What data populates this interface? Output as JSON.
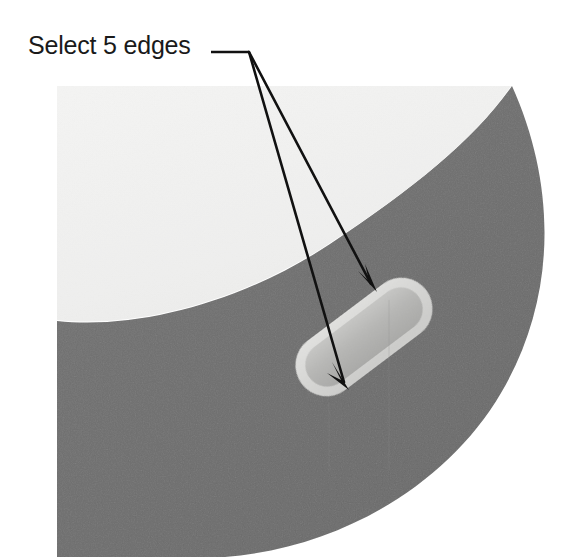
{
  "figure": {
    "kind": "cad-viewport-illustration",
    "width": 582,
    "height": 558,
    "background_color": "#ffffff",
    "annotation": {
      "label": "Select 5 edges",
      "label_color": "#1a1a1a",
      "leader": {
        "kind": "horizontal-leader-line",
        "color": "#111111",
        "from_x": 211,
        "to_x": 249,
        "y": 52
      },
      "arrows": [
        {
          "name": "arrow-to-slot-upper-edge",
          "start_x": 249,
          "start_y": 52,
          "tip_x": 377,
          "tip_y": 292,
          "color": "#111111"
        },
        {
          "name": "arrow-to-slot-lower-edge",
          "start_x": 249,
          "start_y": 52,
          "tip_x": 349,
          "tip_y": 390,
          "color": "#111111"
        }
      ]
    },
    "geometry": {
      "inner_face": {
        "name": "inner-light-face",
        "color": "#f2f2f1",
        "description": "light near-white curved face occupying upper-left"
      },
      "outer_band": {
        "name": "dark-annular-band",
        "color": "#6f6f6f",
        "description": "dark gray annular band sweeping from top-right to bottom-left"
      },
      "slot_feature": {
        "name": "highlighted-slot",
        "fill_color": "#b4b4b2",
        "rim_color": "#d8d8d6",
        "rotation_deg": -37,
        "description": "capsule shaped recessed slot highlighted inside the band"
      }
    }
  }
}
